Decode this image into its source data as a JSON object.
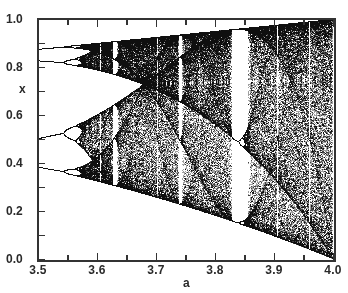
{
  "chart_data": {
    "type": "scatter",
    "title": "",
    "subtitle": "Bifurcation diagram of the logistic map x(n+1) = a·x(n)·(1 − x(n))",
    "xlabel": "a",
    "ylabel": "x",
    "xlim": [
      3.5,
      4.0
    ],
    "ylim": [
      0.0,
      1.0
    ],
    "x_ticks": [
      3.5,
      3.55,
      3.6,
      3.65,
      3.7,
      3.75,
      3.8,
      3.85,
      3.9,
      3.95,
      4.0
    ],
    "x_tick_labels": [
      "3.5",
      "3.6",
      "3.7",
      "3.8",
      "3.9",
      "4.0"
    ],
    "y_ticks": [
      0.0,
      0.1,
      0.2,
      0.3,
      0.4,
      0.5,
      0.6,
      0.7,
      0.8,
      0.9,
      1.0
    ],
    "y_tick_labels": [
      "0.0",
      "0.2",
      "0.4",
      "0.6",
      "0.8",
      "1.0"
    ],
    "grid": false,
    "legend": null,
    "series": [
      {
        "name": "attractor points",
        "color": "#111111",
        "generator": {
          "map": "logistic",
          "a_start": 3.5,
          "a_end": 4.0,
          "a_steps": 590,
          "transient": 300,
          "samples_per_a": 220,
          "x0": 0.5
        }
      }
    ],
    "annotations": {
      "period_doubling_region": [
        3.5,
        3.57
      ],
      "chaos_onset": 3.57,
      "period_3_window": [
        3.828,
        3.857
      ],
      "period_5_window": 3.74,
      "period_6_window": 3.63
    },
    "axis_labels_xy": {
      "x_labels": [
        {
          "text": "3.5",
          "value": 3.5
        },
        {
          "text": "3.6",
          "value": 3.6
        },
        {
          "text": "3.7",
          "value": 3.7
        },
        {
          "text": "3.8",
          "value": 3.8
        },
        {
          "text": "3.9",
          "value": 3.9
        },
        {
          "text": "4.0",
          "value": 4.0
        }
      ],
      "y_labels": [
        {
          "text": "0.0",
          "value": 0.0
        },
        {
          "text": "0.2",
          "value": 0.2
        },
        {
          "text": "0.4",
          "value": 0.4
        },
        {
          "text": "0.6",
          "value": 0.6
        },
        {
          "text": "0.8",
          "value": 0.8
        },
        {
          "text": "1.0",
          "value": 1.0
        }
      ]
    }
  },
  "axes": {
    "x_title": "a",
    "y_title": "x"
  }
}
